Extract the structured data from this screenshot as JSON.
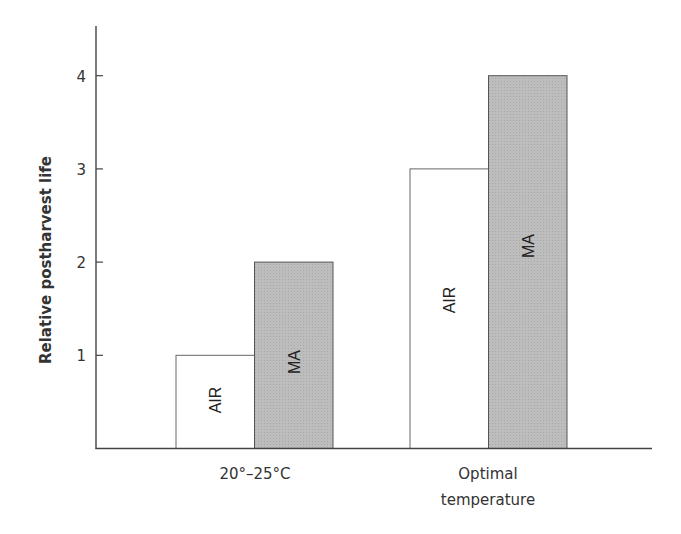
{
  "chart_data": {
    "type": "bar",
    "title": "",
    "xlabel": "",
    "ylabel": "Relative postharvest life",
    "ylim": [
      0,
      4.5
    ],
    "yticks": [
      1,
      2,
      3,
      4
    ],
    "categories": [
      "20°–25°C",
      "Optimal temperature"
    ],
    "category_lines": [
      [
        "20°–25°C"
      ],
      [
        "Optimal",
        "temperature"
      ]
    ],
    "series": [
      {
        "name": "AIR",
        "values": [
          1,
          3
        ],
        "color": "#ffffff",
        "label_in_bar": "AIR"
      },
      {
        "name": "MA",
        "values": [
          2,
          4
        ],
        "color": "#b8b8b8",
        "label_in_bar": "MA"
      }
    ],
    "grid": false,
    "legend": "none (labels inside bars, rotated vertically)"
  }
}
